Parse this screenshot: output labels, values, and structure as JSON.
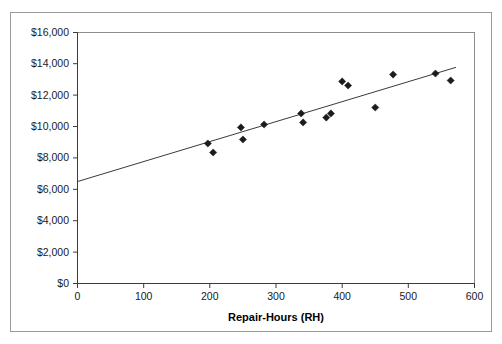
{
  "chart_data": {
    "type": "scatter",
    "title": "",
    "xlabel": "Repair-Hours (RH)",
    "ylabel": "",
    "xlim": [
      0,
      600
    ],
    "ylim": [
      0,
      16000
    ],
    "grid": false,
    "legend": "none",
    "xticks": [
      "0",
      "100",
      "200",
      "300",
      "400",
      "500",
      "600"
    ],
    "xtick_values": [
      0,
      100,
      200,
      300,
      400,
      500,
      600
    ],
    "yticks": [
      "$0",
      "$2,000",
      "$4,000",
      "$6,000",
      "$8,000",
      "$10,000",
      "$12,000",
      "$14,000",
      "$16,000"
    ],
    "ytick_values": [
      0,
      2000,
      4000,
      6000,
      8000,
      10000,
      12000,
      14000,
      16000
    ],
    "points": [
      {
        "x": 197,
        "y": 8925
      },
      {
        "x": 205,
        "y": 8350
      },
      {
        "x": 247,
        "y": 9950
      },
      {
        "x": 250,
        "y": 9180
      },
      {
        "x": 282,
        "y": 10135
      },
      {
        "x": 338,
        "y": 10840
      },
      {
        "x": 341,
        "y": 10265
      },
      {
        "x": 376,
        "y": 10580
      },
      {
        "x": 383,
        "y": 10840
      },
      {
        "x": 400,
        "y": 12880
      },
      {
        "x": 409,
        "y": 12620
      },
      {
        "x": 450,
        "y": 11220
      },
      {
        "x": 477,
        "y": 13320
      },
      {
        "x": 541,
        "y": 13385
      },
      {
        "x": 564,
        "y": 12940
      }
    ],
    "marker": "diamond",
    "marker_color": "#1c1c1c",
    "trendline": {
      "type": "linear",
      "x_start": 0,
      "y_start": 6500,
      "x_end": 572,
      "y_end": 13780,
      "color": "#3a3a3a"
    }
  }
}
